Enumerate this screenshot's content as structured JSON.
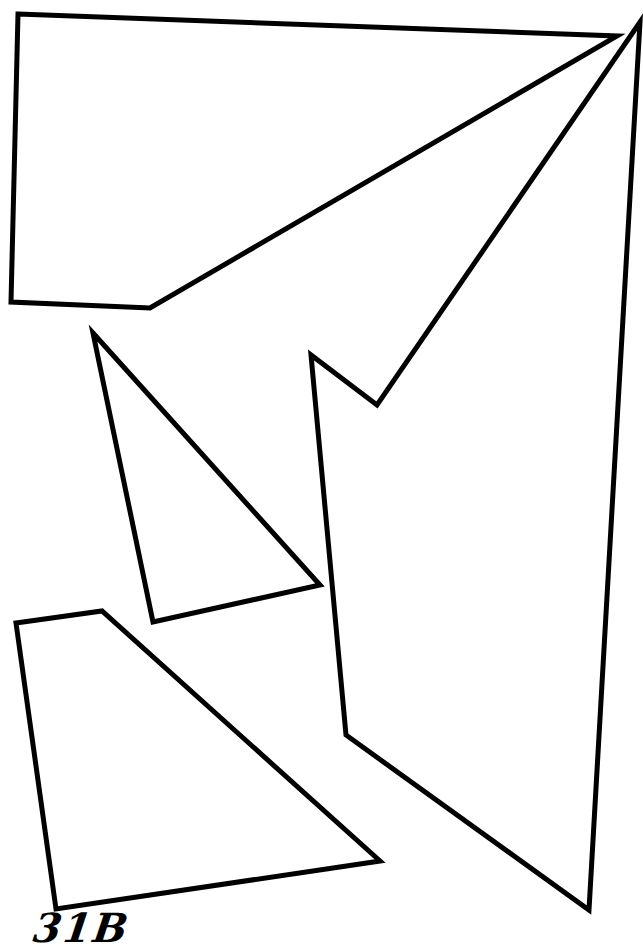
{
  "figure": {
    "width": 643,
    "height": 939,
    "background": "#ffffff",
    "stroke_color": "#000000",
    "stroke_width": 5,
    "label": "31B",
    "shapes": [
      {
        "name": "top-quadrilateral",
        "points": [
          [
            18,
            14
          ],
          [
            617,
            36
          ],
          [
            150,
            308
          ],
          [
            11,
            302
          ]
        ]
      },
      {
        "name": "middle-triangle",
        "points": [
          [
            93,
            333
          ],
          [
            320,
            585
          ],
          [
            153,
            622
          ]
        ]
      },
      {
        "name": "large-right-polygon",
        "points": [
          [
            640,
            22
          ],
          [
            589,
            910
          ],
          [
            346,
            735
          ],
          [
            311,
            355
          ],
          [
            377,
            405
          ]
        ]
      },
      {
        "name": "bottom-quadrilateral",
        "points": [
          [
            16,
            623
          ],
          [
            102,
            611
          ],
          [
            380,
            861
          ],
          [
            56,
            909
          ]
        ]
      }
    ]
  }
}
